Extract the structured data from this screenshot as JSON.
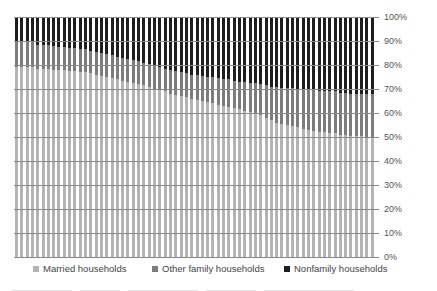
{
  "chart_data": {
    "type": "bar",
    "stacked": true,
    "normalized": true,
    "title": "",
    "xlabel": "",
    "ylabel": "",
    "ylim": [
      0,
      100
    ],
    "yticks": [
      "0%",
      "10%",
      "20%",
      "30%",
      "40%",
      "50%",
      "60%",
      "70%",
      "80%",
      "90%",
      "100%"
    ],
    "grid": true,
    "legend_position": "bottom",
    "n_bars": 68,
    "series": [
      {
        "name": "Married households",
        "color": "#b4b4b4",
        "values": [
          79,
          79,
          79,
          79,
          78.5,
          78.5,
          78.5,
          78,
          78,
          78,
          77.5,
          77.5,
          77,
          77,
          76.5,
          76,
          75.5,
          75,
          74.5,
          74,
          73.5,
          73,
          72.5,
          72,
          71.5,
          71,
          70,
          69.5,
          69,
          68,
          67.5,
          67,
          66.5,
          66,
          65.5,
          65,
          64.5,
          64,
          63.5,
          63,
          62.5,
          62,
          61.5,
          61,
          60.5,
          60,
          59,
          58,
          57,
          56,
          55.5,
          55,
          54.5,
          54,
          53.5,
          53,
          52.5,
          52,
          52,
          51.5,
          51.5,
          51,
          51,
          50.5,
          50.5,
          50.5,
          50,
          50
        ]
      },
      {
        "name": "Other family households",
        "color": "#7c7c7c",
        "values": [
          10.5,
          10.5,
          10.5,
          10.5,
          10,
          10,
          10,
          10,
          9.5,
          9.5,
          9.5,
          9.5,
          9.5,
          9.5,
          9.5,
          9.5,
          9.5,
          9.5,
          9.5,
          9.5,
          9.5,
          9.5,
          9.5,
          9.5,
          9.5,
          9.5,
          9.5,
          9.5,
          9.5,
          10,
          10,
          10,
          10,
          10,
          10.5,
          10.5,
          10.5,
          11,
          11,
          11,
          11.5,
          11.5,
          11.5,
          12,
          12,
          12.5,
          13,
          13.5,
          14,
          15,
          15,
          15.5,
          16,
          16,
          16.5,
          16.5,
          17,
          17,
          17,
          17.5,
          17.5,
          17.5,
          17.5,
          17.5,
          17.5,
          17.5,
          18,
          18
        ]
      },
      {
        "name": "Nonfamily households",
        "color": "#1e1e1e",
        "values": [
          10.5,
          10.5,
          10.5,
          10.5,
          11.5,
          11.5,
          11.5,
          12,
          12.5,
          12.5,
          13,
          13,
          13.5,
          13.5,
          14,
          14.5,
          15,
          15.5,
          16,
          16.5,
          17,
          17.5,
          18,
          18.5,
          19,
          19.5,
          20.5,
          21,
          21.5,
          22,
          22.5,
          23,
          23.5,
          24,
          24,
          24.5,
          25,
          25,
          25.5,
          26,
          26,
          26.5,
          27,
          27,
          27.5,
          27.5,
          28,
          28.5,
          29,
          29,
          29.5,
          29.5,
          29.5,
          30,
          30,
          30.5,
          30.5,
          31,
          31,
          31,
          31,
          31.5,
          31.5,
          32,
          32,
          32,
          32,
          32
        ]
      }
    ]
  },
  "legend": {
    "items": [
      {
        "label": "Married households",
        "color": "#b4b4b4"
      },
      {
        "label": "Other family households",
        "color": "#7c7c7c"
      },
      {
        "label": "Nonfamily households",
        "color": "#1e1e1e"
      }
    ]
  }
}
